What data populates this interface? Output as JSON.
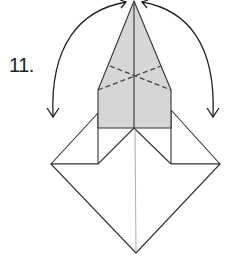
{
  "diagram": {
    "type": "origami-instruction-step",
    "step_number": "11.",
    "colors": {
      "paper_colored_side": "#d6d6d6",
      "paper_white_side": "#ffffff",
      "line": "#333333",
      "dashed_fold": "#444444"
    },
    "elements": [
      {
        "name": "colored-kite-flap",
        "description": "Gray pointed flap at top"
      },
      {
        "name": "valley-fold-lines",
        "description": "Two crossing dashed lines on the gray flap"
      },
      {
        "name": "lower-diamond",
        "description": "White square base rotated as diamond"
      },
      {
        "name": "left-arrow",
        "description": "Curved arrow from apex down to the left"
      },
      {
        "name": "right-arrow",
        "description": "Curved arrow from apex down to the right"
      }
    ]
  }
}
